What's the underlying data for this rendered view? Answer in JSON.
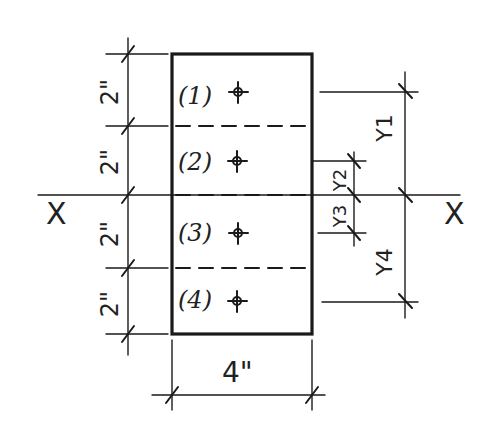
{
  "diagram": {
    "title": "",
    "section": {
      "width_label": "4\"",
      "segments": [
        {
          "id": "1",
          "label": "(1)",
          "height_label": "2\""
        },
        {
          "id": "2",
          "label": "(2)",
          "height_label": "2\""
        },
        {
          "id": "3",
          "label": "(3)",
          "height_label": "2\""
        },
        {
          "id": "4",
          "label": "(4)",
          "height_label": "2\""
        }
      ]
    },
    "axis": {
      "left_label": "X",
      "right_label": "X"
    },
    "distances": [
      {
        "label": "Y1"
      },
      {
        "label": "Y2"
      },
      {
        "label": "Y3"
      },
      {
        "label": "Y4"
      }
    ]
  }
}
